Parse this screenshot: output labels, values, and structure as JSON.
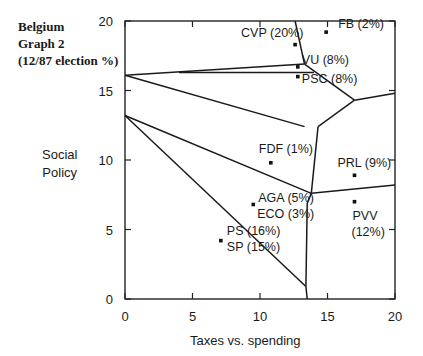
{
  "chart_data": {
    "type": "scatter",
    "title": "Belgium Graph 2 (12/87 election %)",
    "title_lines": [
      "Belgium",
      "Graph 2",
      "(12/87 election %)"
    ],
    "xlabel": "Taxes vs. spending",
    "ylabel": "Social Policy",
    "ylabel_lines": [
      "Social",
      "Policy"
    ],
    "xlim": [
      0,
      20
    ],
    "ylim": [
      0,
      20
    ],
    "xticks": [
      0,
      5,
      10,
      15,
      20
    ],
    "yticks": [
      0,
      5,
      10,
      15,
      20
    ],
    "grid": false,
    "points": [
      {
        "party": "CVP",
        "share": "20%",
        "label": "CVP (20%)",
        "x": 12.6,
        "y": 18.3
      },
      {
        "party": "FB",
        "share": "2%",
        "label": "FB (2%)",
        "x": 14.9,
        "y": 19.2
      },
      {
        "party": "VU",
        "share": "8%",
        "label": "VU (8%)",
        "x": 12.8,
        "y": 16.7
      },
      {
        "party": "PSC",
        "share": "8%",
        "label": "PSC (8%)",
        "x": 12.8,
        "y": 16.0
      },
      {
        "party": "FDF",
        "share": "1%",
        "label": "FDF (1%)",
        "x": 10.8,
        "y": 9.8
      },
      {
        "party": "PRL",
        "share": "9%",
        "label": "PRL (9%)",
        "x": 17.0,
        "y": 8.9
      },
      {
        "party": "AGA/ECO",
        "share": "5% / 3%",
        "label": "AGA (5%) ECO (3%)",
        "x": 9.5,
        "y": 6.8
      },
      {
        "party": "PVV",
        "share": "12%",
        "label": "PVV (12%)",
        "x": 17.0,
        "y": 7.0
      },
      {
        "party": "PS/SP",
        "share": "16% / 15%",
        "label": "PS (16%) SP (15%)",
        "x": 7.1,
        "y": 4.2
      }
    ],
    "region_boundaries": [
      [
        [
          0,
          16.1
        ],
        [
          13.3,
          12.4
        ]
      ],
      [
        [
          0,
          16.1
        ],
        [
          13.3,
          16.9
        ]
      ],
      [
        [
          4,
          16.3
        ],
        [
          14.0,
          16.3
        ]
      ],
      [
        [
          12.6,
          20
        ],
        [
          13.3,
          16.9
        ]
      ],
      [
        [
          13.3,
          16.9
        ],
        [
          17.0,
          14.3
        ]
      ],
      [
        [
          17.0,
          14.3
        ],
        [
          20,
          14.8
        ]
      ],
      [
        [
          17.0,
          14.3
        ],
        [
          14.3,
          12.4
        ]
      ],
      [
        [
          14.3,
          12.4
        ],
        [
          13.8,
          7.6
        ]
      ],
      [
        [
          0,
          13.2
        ],
        [
          13.8,
          7.6
        ]
      ],
      [
        [
          13.8,
          7.6
        ],
        [
          20,
          8.2
        ]
      ],
      [
        [
          13.8,
          7.6
        ],
        [
          13.5,
          6.9
        ]
      ],
      [
        [
          0,
          13.2
        ],
        [
          13.4,
          0.9
        ]
      ],
      [
        [
          13.5,
          6.9
        ],
        [
          13.4,
          0.9
        ]
      ],
      [
        [
          13.4,
          0.9
        ],
        [
          13.5,
          0
        ]
      ]
    ]
  }
}
